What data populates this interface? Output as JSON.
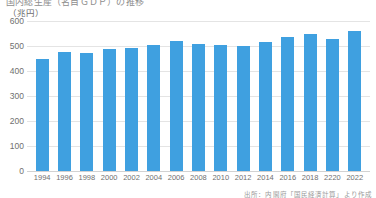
{
  "header": {
    "cut_title": "国内総生産（名目ＧＤＰ）の推移",
    "unit_label": "（兆円）"
  },
  "footer": {
    "source": "出所：内閣府「国民経済計算」より作成"
  },
  "chart_data": {
    "type": "bar",
    "title": "国内総生産（名目ＧＤＰ）の推移",
    "xlabel": "",
    "ylabel": "（兆円）",
    "ylim": [
      0,
      600
    ],
    "yticks": [
      0,
      100,
      200,
      300,
      400,
      500,
      600
    ],
    "ytick_labels": [
      "0",
      "100",
      "200",
      "300",
      "400",
      "500",
      "600"
    ],
    "grid": true,
    "legend": "none",
    "bar_color": "#3fa0e0",
    "categories": [
      "1994",
      "1996",
      "1998",
      "2000",
      "2002",
      "2004",
      "2006",
      "2008",
      "2010",
      "2012",
      "2014",
      "2016",
      "2018",
      "2220",
      "2022"
    ],
    "values": [
      450,
      475,
      473,
      489,
      491,
      504,
      522,
      510,
      505,
      500,
      518,
      538,
      547,
      528,
      560
    ]
  }
}
